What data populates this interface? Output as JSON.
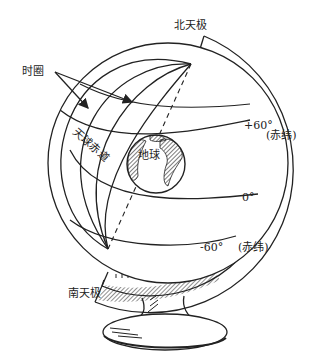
{
  "diagram": {
    "type": "celestial-globe",
    "labels": {
      "hour_circle": "时圈",
      "north_pole": "北天极",
      "celestial_equator": "天球赤道",
      "earth": "地球",
      "dec_plus60": "+60°",
      "dec_label_1": "(赤纬)",
      "dec_zero": "0°",
      "dec_minus60": "-60°",
      "dec_label_2": "(赤纬)",
      "south_pole": "南天极"
    },
    "colors": {
      "line": "#222222",
      "background": "#ffffff"
    }
  }
}
